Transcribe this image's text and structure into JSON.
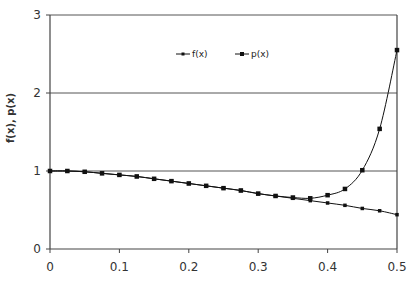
{
  "chart_data": {
    "type": "line",
    "title": "",
    "xlabel": "",
    "ylabel": "f(x), p(x)",
    "xlim": [
      0,
      0.5
    ],
    "ylim": [
      0,
      3
    ],
    "xticks": [
      0,
      0.1,
      0.2,
      0.3,
      0.4,
      0.5
    ],
    "xtick_labels": [
      "0",
      "0.1",
      "0.2",
      "0.3",
      "0.4",
      "0.5"
    ],
    "yticks": [
      0,
      1,
      2,
      3
    ],
    "ytick_labels": [
      "0",
      "1",
      "2",
      "3"
    ],
    "grid": "horizontal",
    "legend_position": "top-center",
    "x": [
      0,
      0.025,
      0.05,
      0.075,
      0.1,
      0.125,
      0.15,
      0.175,
      0.2,
      0.225,
      0.25,
      0.275,
      0.3,
      0.325,
      0.35,
      0.375,
      0.4,
      0.425,
      0.45,
      0.475,
      0.5
    ],
    "series": [
      {
        "name": "f(x)",
        "label": "f(x)",
        "marker": "small-square",
        "color": "#111111",
        "values": [
          1.0,
          1.0,
          0.99,
          0.97,
          0.95,
          0.93,
          0.9,
          0.87,
          0.84,
          0.81,
          0.78,
          0.75,
          0.71,
          0.68,
          0.65,
          0.62,
          0.59,
          0.56,
          0.52,
          0.49,
          0.44
        ]
      },
      {
        "name": "p(x)",
        "label": "p(x)",
        "marker": "square",
        "color": "#111111",
        "values": [
          1.0,
          1.0,
          0.99,
          0.97,
          0.95,
          0.93,
          0.9,
          0.87,
          0.84,
          0.81,
          0.78,
          0.75,
          0.71,
          0.68,
          0.66,
          0.65,
          0.69,
          0.77,
          1.01,
          1.54,
          2.55
        ]
      }
    ]
  }
}
